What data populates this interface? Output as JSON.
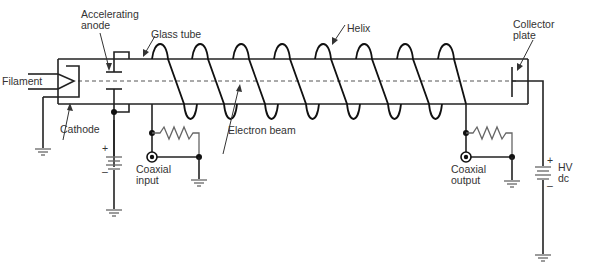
{
  "diagram": {
    "type": "traveling-wave-tube schematic",
    "labels": {
      "filament": "Filament",
      "accelerating_anode_line1": "Accelerating",
      "accelerating_anode_line2": "anode",
      "glass_tube": "Glass tube",
      "helix": "Helix",
      "collector_line1": "Collector",
      "collector_line2": "plate",
      "cathode": "Cathode",
      "electron_beam": "Electron beam",
      "coaxial_input_line1": "Coaxial",
      "coaxial_input_line2": "input",
      "coaxial_output_line1": "Coaxial",
      "coaxial_output_line2": "output",
      "hv_line1": "HV",
      "hv_line2": "dc",
      "plus_left": "+",
      "minus_left": "–",
      "plus_right": "+",
      "minus_right": "–"
    },
    "colors": {
      "line": "#222222",
      "label_text": "#333333",
      "background": "#ffffff"
    }
  }
}
